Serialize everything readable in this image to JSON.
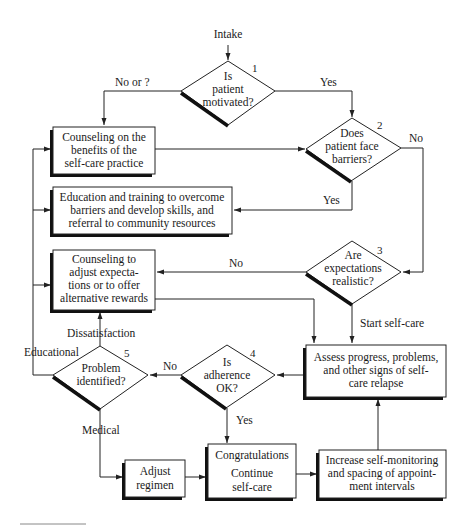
{
  "diagram": {
    "type": "flowchart",
    "colors": {
      "line": "#222222",
      "shadow": "#111111",
      "fill": "#ffffff"
    },
    "start_label": "Intake",
    "decisions": [
      {
        "id": "d1",
        "number": "1",
        "lines": [
          "Is",
          "patient",
          "motivated?"
        ]
      },
      {
        "id": "d2",
        "number": "2",
        "lines": [
          "Does",
          "patient face",
          "barriers?"
        ]
      },
      {
        "id": "d3",
        "number": "3",
        "lines": [
          "Are",
          "expectations",
          "realistic?"
        ]
      },
      {
        "id": "d4",
        "number": "4",
        "lines": [
          "Is",
          "adherence",
          "OK?"
        ]
      },
      {
        "id": "d5",
        "number": "5",
        "lines": [
          "Problem",
          "identified?"
        ]
      }
    ],
    "boxes": [
      {
        "id": "counsel_benefits",
        "lines": [
          "Counseling on the",
          "benefits of the",
          "self-care practice"
        ]
      },
      {
        "id": "education",
        "lines": [
          "Education and training to overcome",
          "barriers and develop skills, and",
          "referral to community resources"
        ]
      },
      {
        "id": "counsel_adjust",
        "lines": [
          "Counseling to",
          "adjust expecta-",
          "tions or to offer",
          "alternative rewards"
        ]
      },
      {
        "id": "assess",
        "lines": [
          "Assess progress, problems,",
          "and other signs of self-",
          "care relapse"
        ]
      },
      {
        "id": "adjust_regimen",
        "lines": [
          "Adjust",
          "regimen"
        ]
      },
      {
        "id": "congrats",
        "lines": [
          "Congratulations",
          "Continue",
          "self-care"
        ]
      },
      {
        "id": "increase",
        "lines": [
          "Increase self-monitoring",
          "and spacing of appoint-",
          "ment intervals"
        ]
      }
    ],
    "edge_labels": {
      "d1_no": "No or ?",
      "d1_yes": "Yes",
      "d2_no": "No",
      "d2_yes": "Yes",
      "d3_no": "No",
      "d3_yes": "Start self-care",
      "d4_no": "No",
      "d4_yes": "Yes",
      "d5_educational": "Educational",
      "d5_dissatisfaction": "Dissatisfaction",
      "d5_medical": "Medical"
    }
  }
}
